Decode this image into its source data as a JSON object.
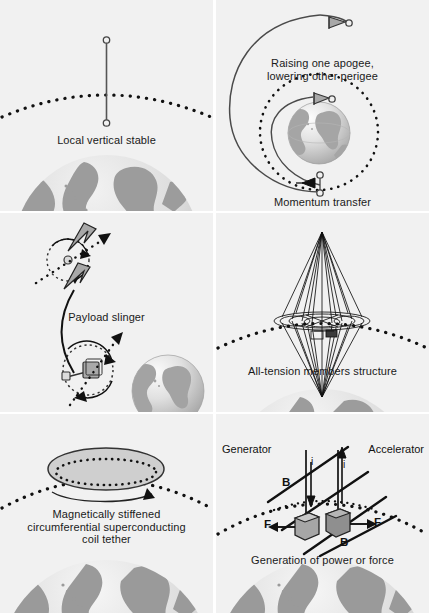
{
  "figure": {
    "panel_bg": "#f1f1f1",
    "ink": "#1a1a1a",
    "earth_light": "#d8d8d8",
    "earth_dark": "#9a9a9a"
  },
  "panels": [
    {
      "id": "local-vertical-stable",
      "caption": "Local vertical stable",
      "elements": [
        "vertical tether line",
        "two end masses",
        "dashed orbit arc",
        "earth limb"
      ]
    },
    {
      "id": "momentum-transfer",
      "caption_top": "Raising one apogee,\nlowering other perigee",
      "caption_top_line1": "Raising one apogee,",
      "caption_top_line2": "lowering other perigee",
      "caption": "Momentum transfer",
      "elements": [
        "large elliptical transfer orbit",
        "dashed circular orbit",
        "earth globe",
        "two arrow heads"
      ]
    },
    {
      "id": "payload-slinger",
      "caption": "Payload slinger",
      "elements": [
        "rotating tether upper",
        "rotating tether lower",
        "payload box",
        "dashed spin circles",
        "curved trajectory",
        "earth globe"
      ]
    },
    {
      "id": "all-tension-members",
      "caption": "All-tension members structure",
      "elements": [
        "bipyramid tensegrity",
        "dashed orbit arc",
        "earth limb"
      ]
    },
    {
      "id": "magnetic-coil-tether",
      "caption_line1": "Magnetically stiffened",
      "caption_line2": "circumferential superconducting",
      "caption_line3": "coil tether",
      "caption": "Magnetically stiffened circumferential superconducting coil tether",
      "elements": [
        "ellipse coil",
        "dashed inner circumference",
        "rotation arrow",
        "dashed orbit arc",
        "earth limb"
      ]
    },
    {
      "id": "power-or-force",
      "caption": "Generation of power or force",
      "label_left": "Generator",
      "label_right": "Accelerator",
      "label_b_upper": "B",
      "label_b_lower": "B",
      "label_i_left": "i",
      "label_i_right": "i",
      "label_f_left": "F",
      "label_f_right": "F",
      "elements": [
        "magnetic field lines",
        "current arrows",
        "two conductor blocks",
        "force arrows",
        "dashed orbit arc",
        "earth limb"
      ]
    }
  ]
}
